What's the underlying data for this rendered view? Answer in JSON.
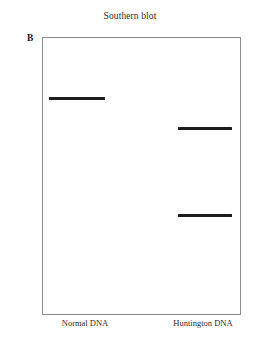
{
  "figure": {
    "panel_label": "B",
    "title": "Southern blot"
  },
  "gel": {
    "box": {
      "x": 42,
      "y": 37,
      "width": 199,
      "height": 278
    },
    "border_color": "#8c8c8c",
    "background_color": "#ffffff",
    "band_color": "#1c1c1c"
  },
  "lanes": [
    {
      "name": "normal-dna",
      "label": "Normal DNA",
      "label_x": 85,
      "label_y": 318,
      "bands": [
        {
          "name": "normal-allele-band",
          "x": 49,
          "y": 97,
          "width": 56,
          "height": 3
        }
      ]
    },
    {
      "name": "huntington-dna",
      "label": "Huntington DNA",
      "label_x": 203,
      "label_y": 318,
      "bands": [
        {
          "name": "expanded-allele-band",
          "x": 178,
          "y": 127,
          "width": 54,
          "height": 3
        },
        {
          "name": "normal-allele-band",
          "x": 178,
          "y": 214,
          "width": 54,
          "height": 3
        }
      ]
    }
  ]
}
